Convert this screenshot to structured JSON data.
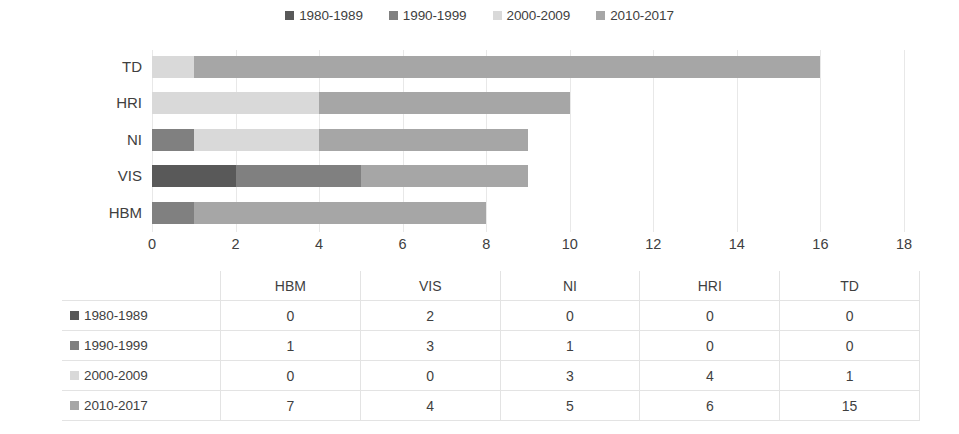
{
  "chart_data": {
    "type": "bar",
    "orientation": "horizontal",
    "stacked": true,
    "title": "",
    "xlabel": "",
    "ylabel": "",
    "xlim": [
      0,
      18
    ],
    "xticks": [
      0,
      2,
      4,
      6,
      8,
      10,
      12,
      14,
      16,
      18
    ],
    "grid": true,
    "legend_position": "top",
    "categories": [
      "HBM",
      "VIS",
      "NI",
      "HRI",
      "TD"
    ],
    "categories_display_order": [
      "TD",
      "HRI",
      "NI",
      "VIS",
      "HBM"
    ],
    "series": [
      {
        "name": "1980-1989",
        "color": "#595959",
        "values": [
          0,
          2,
          0,
          0,
          0
        ]
      },
      {
        "name": "1990-1999",
        "color": "#808080",
        "values": [
          1,
          3,
          1,
          0,
          0
        ]
      },
      {
        "name": "2000-2009",
        "color": "#D9D9D9",
        "values": [
          0,
          0,
          3,
          4,
          1
        ]
      },
      {
        "name": "2010-2017",
        "color": "#A6A6A6",
        "values": [
          7,
          4,
          5,
          6,
          15
        ]
      }
    ],
    "totals": [
      8,
      9,
      9,
      10,
      16
    ]
  },
  "legend": {
    "items": [
      {
        "label": "1980-1989",
        "color": "#595959"
      },
      {
        "label": "1990-1999",
        "color": "#808080"
      },
      {
        "label": "2000-2009",
        "color": "#D9D9D9"
      },
      {
        "label": "2010-2017",
        "color": "#A6A6A6"
      }
    ]
  },
  "axis": {
    "yticklabels": [
      "TD",
      "HRI",
      "NI",
      "VIS",
      "HBM"
    ],
    "xticklabels": [
      "0",
      "2",
      "4",
      "6",
      "8",
      "10",
      "12",
      "14",
      "16",
      "18"
    ]
  },
  "table": {
    "corner_label": "",
    "columns": [
      "HBM",
      "VIS",
      "NI",
      "HRI",
      "TD"
    ],
    "rows": [
      {
        "label": "1980-1989",
        "color": "#595959",
        "cells": [
          "0",
          "2",
          "0",
          "0",
          "0"
        ]
      },
      {
        "label": "1990-1999",
        "color": "#808080",
        "cells": [
          "1",
          "3",
          "1",
          "0",
          "0"
        ]
      },
      {
        "label": "2000-2009",
        "color": "#D9D9D9",
        "cells": [
          "0",
          "0",
          "3",
          "4",
          "1"
        ]
      },
      {
        "label": "2010-2017",
        "color": "#A6A6A6",
        "cells": [
          "7",
          "4",
          "5",
          "6",
          "15"
        ]
      }
    ]
  }
}
